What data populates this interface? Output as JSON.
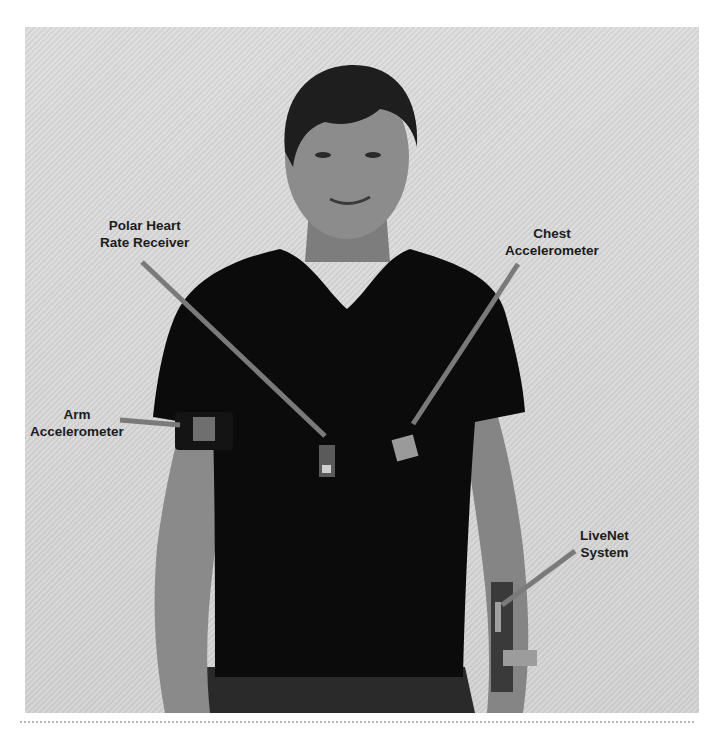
{
  "figure": {
    "background_color": "#d8d8d8",
    "callout_line_color": "#7a7a7a",
    "label_color": "#1c1c1c",
    "callouts": [
      {
        "id": "polar",
        "lines": [
          "Polar Heart",
          "Rate Receiver"
        ]
      },
      {
        "id": "chest",
        "lines": [
          "Chest",
          "Accelerometer"
        ]
      },
      {
        "id": "arm",
        "lines": [
          "Arm",
          "Accelerometer"
        ]
      },
      {
        "id": "livenet",
        "lines": [
          "LiveNet",
          "System"
        ]
      }
    ]
  }
}
